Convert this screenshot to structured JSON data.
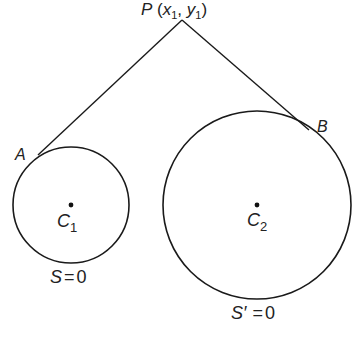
{
  "diagram": {
    "point_p": {
      "name": "P",
      "label_x": "x",
      "label_y": "y",
      "sub": "1",
      "pos": [
        182,
        20
      ]
    },
    "tangent_points": [
      {
        "name": "A",
        "pos": [
          38,
          155
        ]
      },
      {
        "name": "B",
        "pos": [
          308,
          130
        ]
      }
    ],
    "circles": [
      {
        "center_name": "C",
        "center_sub": "1",
        "center": [
          71,
          205
        ],
        "radius": 58,
        "equation_lhs": "S",
        "equation_rhs": "0",
        "equation_sign": "="
      },
      {
        "center_name": "C",
        "center_sub": "2",
        "center": [
          257,
          205
        ],
        "radius": 94,
        "equation_lhs": "S′",
        "equation_rhs": "0",
        "equation_sign": "="
      }
    ],
    "stroke_color": "#1a1a1a",
    "text_color": "#222222"
  }
}
